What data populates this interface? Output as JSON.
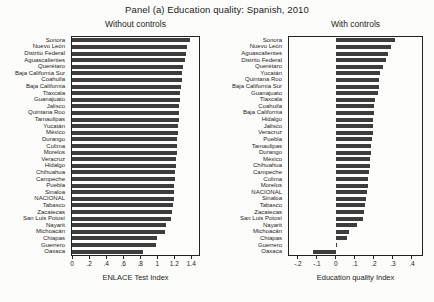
{
  "figure": {
    "title": "Panel (a) Education quality: Spanish, 2010",
    "bar_color": "#3d3d3d",
    "axis_color": "#222222",
    "background": "#fcfcfa"
  },
  "chart_data": [
    {
      "type": "bar",
      "orientation": "horizontal",
      "title": "Without controls",
      "xlabel": "ENLACE Test Index",
      "xlim": [
        0,
        1.49
      ],
      "grid": false,
      "xticks": [
        0,
        0.2,
        0.4,
        0.6,
        0.8,
        1,
        1.2,
        1.4
      ],
      "xtick_labels": [
        "0",
        ".2",
        ".4",
        ".6",
        ".8",
        "1",
        "1.2",
        "1.4"
      ],
      "categories": [
        "Sonora",
        "Nuevo León",
        "Distrito Federal",
        "Aguascalientes",
        "Querétaro",
        "Baja California Sur",
        "Coahuila",
        "Baja California",
        "Tlaxcala",
        "Guanajuato",
        "Jalisco",
        "Quintana Roo",
        "Tamaulipas",
        "Yucatán",
        "México",
        "Durango",
        "Colima",
        "Morelos",
        "Veracruz",
        "Hidalgo",
        "Chihuahua",
        "Campeche",
        "Puebla",
        "Sinaloa",
        "NACIONAL",
        "Tabasco",
        "Zacatecas",
        "San Luis Potosí",
        "Nayarit",
        "Michoacán",
        "Chiapas",
        "Guerrero",
        "Oaxaca"
      ],
      "values": [
        1.38,
        1.353,
        1.34,
        1.327,
        1.308,
        1.295,
        1.288,
        1.283,
        1.27,
        1.262,
        1.257,
        1.253,
        1.25,
        1.246,
        1.242,
        1.237,
        1.232,
        1.227,
        1.222,
        1.217,
        1.212,
        1.207,
        1.202,
        1.197,
        1.192,
        1.183,
        1.173,
        1.162,
        1.1,
        1.088,
        1.0,
        0.985,
        0.828
      ]
    },
    {
      "type": "bar",
      "orientation": "horizontal",
      "title": "With controls",
      "xlabel": "Education quality Index",
      "xlim": [
        -0.247,
        0.453
      ],
      "grid": false,
      "xticks": [
        -0.2,
        -0.1,
        0,
        0.1,
        0.2,
        0.3,
        0.4
      ],
      "xtick_labels": [
        "-.2",
        "-.1",
        "0",
        ".1",
        ".2",
        ".3",
        ".4"
      ],
      "categories": [
        "Sonora",
        "Nuevo León",
        "Aguascalientes",
        "Distrito Federal",
        "Querétaro",
        "Yucatán",
        "Quintana Roo",
        "Baja California Sur",
        "Guanajuato",
        "Tlaxcala",
        "Coahuila",
        "Baja California",
        "Hidalgo",
        "Jalisco",
        "Veracruz",
        "Puebla",
        "Tamaulipas",
        "Durango",
        "México",
        "Chihuahua",
        "Campeche",
        "Colima",
        "Morelos",
        "NACIONAL",
        "Sinaloa",
        "Tabasco",
        "Zacatecas",
        "San Luis Potosí",
        "Nayarit",
        "Michoacán",
        "Chiapas",
        "Guerrero",
        "Oaxaca"
      ],
      "values": [
        0.31,
        0.29,
        0.272,
        0.262,
        0.246,
        0.234,
        0.229,
        0.225,
        0.221,
        0.204,
        0.201,
        0.199,
        0.196,
        0.195,
        0.194,
        0.19,
        0.186,
        0.184,
        0.181,
        0.177,
        0.174,
        0.171,
        0.168,
        0.166,
        0.16,
        0.151,
        0.146,
        0.141,
        0.11,
        0.068,
        0.056,
        0.008,
        -0.12
      ]
    }
  ]
}
